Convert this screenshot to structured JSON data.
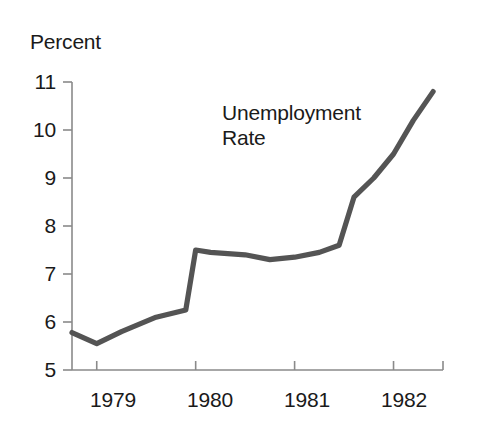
{
  "chart_data": {
    "type": "line",
    "title": "",
    "xlabel": "",
    "ylabel": "Percent",
    "ylim": [
      5,
      11
    ],
    "xlim": [
      1978.75,
      1982.5
    ],
    "grid": false,
    "legend": "none",
    "annotations": [
      {
        "text": "Unemployment\nRate",
        "x": 1980.9,
        "y": 10.0
      }
    ],
    "y_ticks": [
      "11",
      "10",
      "9",
      "8",
      "7",
      "6",
      "5"
    ],
    "y_tick_values": [
      11,
      10,
      9,
      8,
      7,
      6,
      5
    ],
    "x_ticks": [
      "1979",
      "1980",
      "1981",
      "1982"
    ],
    "x_tick_values": [
      1979,
      1980,
      1981,
      1982
    ],
    "series": [
      {
        "name": "Unemployment Rate",
        "color": "#545454",
        "x": [
          1978.75,
          1979.0,
          1979.25,
          1979.6,
          1979.9,
          1980.0,
          1980.15,
          1980.5,
          1980.75,
          1981.0,
          1981.25,
          1981.45,
          1981.6,
          1981.8,
          1982.0,
          1982.2,
          1982.4
        ],
        "values": [
          5.78,
          5.55,
          5.8,
          6.1,
          6.25,
          7.5,
          7.45,
          7.4,
          7.3,
          7.35,
          7.45,
          7.6,
          8.6,
          9.0,
          9.5,
          10.2,
          10.8
        ]
      }
    ]
  },
  "axis": {
    "color": "#8a8a8a",
    "tick_color": "#8a8a8a"
  },
  "line_color": "#545454",
  "text_color": "#1a1a1a"
}
